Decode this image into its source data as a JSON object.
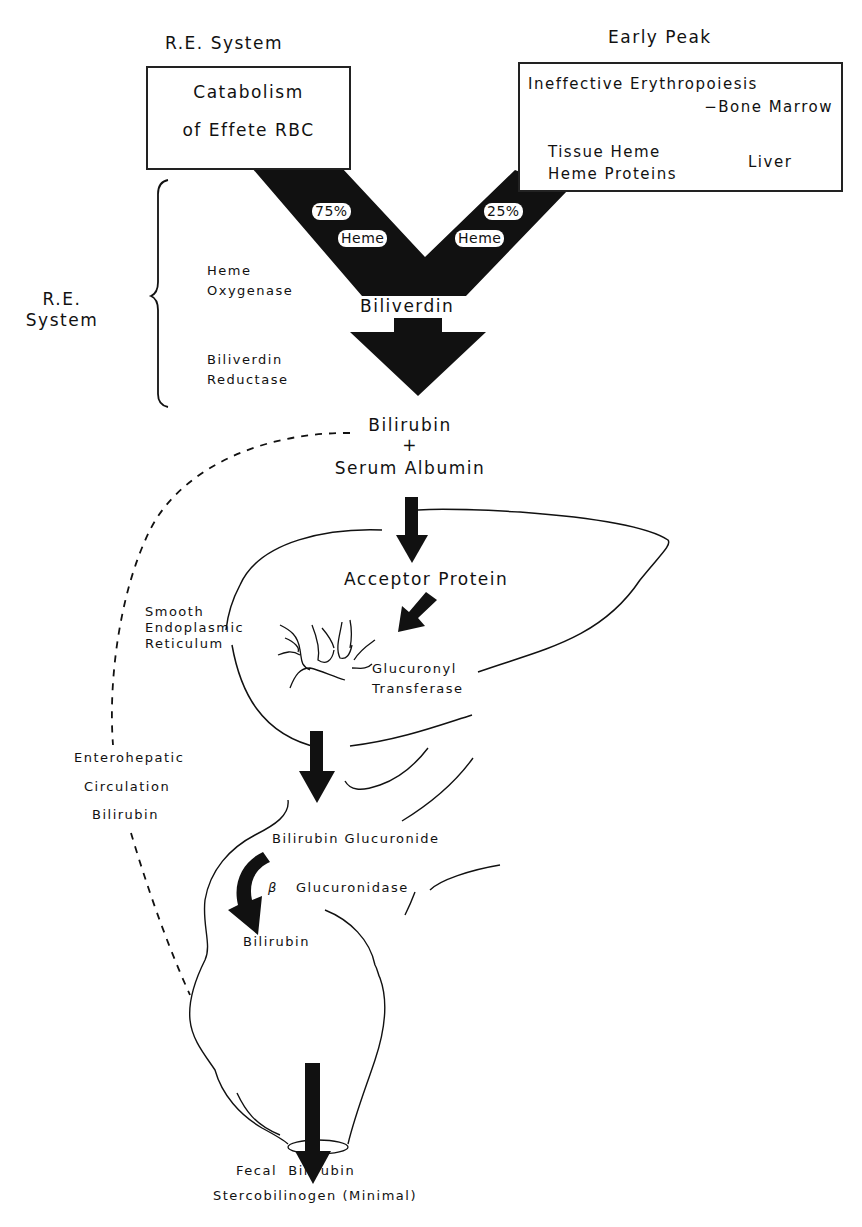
{
  "diagram": {
    "title_left": "R.E. System",
    "title_right": "Early Peak",
    "box_left": {
      "line1": "Catabolism",
      "line2": "of Effete RBC"
    },
    "box_right": {
      "line1": "Ineffective Erythropoiesis",
      "line2": "−Bone Marrow",
      "line3": "Tissue Heme",
      "line4": "Heme Proteins",
      "brace_label": "Liver"
    },
    "v_shape": {
      "left_percent": "75%",
      "left_label": "Heme",
      "right_percent": "25%",
      "right_label": "Heme",
      "product": "Biliverdin"
    },
    "re_system_bracket": {
      "label_line1": "R.E.",
      "label_line2": "System",
      "enzyme1_line1": "Heme",
      "enzyme1_line2": "Oxygenase",
      "enzyme2_line1": "Biliverdin",
      "enzyme2_line2": "Reductase"
    },
    "bilirubin_complex": {
      "line1": "Bilirubin",
      "plus": "+",
      "line2": "Serum Albumin"
    },
    "liver": {
      "acceptor": "Acceptor Protein",
      "ser_line1": "Smooth",
      "ser_line2": "Endoplasmic",
      "ser_line3": "Reticulum",
      "enzyme_line1": "Glucuronyl",
      "enzyme_line2": "Transferase"
    },
    "enterohepatic": {
      "line1": "Enterohepatic",
      "line2": "Circulation",
      "line3": "Bilirubin"
    },
    "intestine": {
      "conjugate": "Bilirubin Glucuronide",
      "beta": "β",
      "enzyme": "Glucuronidase",
      "product": "Bilirubin"
    },
    "output": {
      "line1": "Fecal  Bilirubin",
      "line2": "Stercobilinogen (Minimal)"
    }
  },
  "colors": {
    "ink": "#111111",
    "background": "#ffffff"
  }
}
